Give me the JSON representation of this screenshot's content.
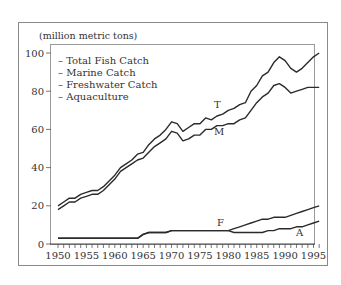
{
  "chart_data": {
    "type": "line",
    "title": "",
    "unit_label": "(million metric tons)",
    "xlabel": "",
    "ylabel": "(million metric tons)",
    "xlim": [
      1950,
      1996
    ],
    "ylim": [
      0,
      100
    ],
    "grid": false,
    "legend_position": "upper-left-inside",
    "x_ticks": [
      1950,
      1955,
      1960,
      1965,
      1970,
      1975,
      1980,
      1985,
      1990,
      1995
    ],
    "y_ticks": [
      0,
      20,
      40,
      60,
      80,
      100
    ],
    "legend": [
      "– Total Fish Catch",
      "– Marine Catch",
      "– Freshwater Catch",
      "– Aquaculture"
    ],
    "x": [
      1950,
      1951,
      1952,
      1953,
      1954,
      1955,
      1956,
      1957,
      1958,
      1959,
      1960,
      1961,
      1962,
      1963,
      1964,
      1965,
      1966,
      1967,
      1968,
      1969,
      1970,
      1971,
      1972,
      1973,
      1974,
      1975,
      1976,
      1977,
      1978,
      1979,
      1980,
      1981,
      1982,
      1983,
      1984,
      1985,
      1986,
      1987,
      1988,
      1989,
      1990,
      1991,
      1992,
      1993,
      1994,
      1995,
      1996
    ],
    "series": [
      {
        "name": "Total Fish Catch",
        "tag": "T",
        "values": [
          20,
          22,
          24,
          24,
          26,
          27,
          28,
          28,
          30,
          33,
          36,
          40,
          42,
          44,
          47,
          48,
          52,
          55,
          57,
          60,
          64,
          63,
          59,
          61,
          63,
          63,
          66,
          65,
          67,
          68,
          70,
          71,
          73,
          74,
          80,
          83,
          88,
          90,
          95,
          98,
          96,
          92,
          90,
          92,
          95,
          98,
          100
        ]
      },
      {
        "name": "Marine Catch",
        "tag": "M",
        "values": [
          18,
          20,
          22,
          22,
          24,
          25,
          26,
          26,
          28,
          31,
          34,
          38,
          40,
          42,
          44,
          45,
          48,
          51,
          53,
          55,
          59,
          58,
          54,
          55,
          57,
          57,
          60,
          60,
          62,
          62,
          63,
          63,
          65,
          66,
          70,
          74,
          77,
          79,
          83,
          84,
          82,
          79,
          80,
          81,
          82,
          82,
          82
        ]
      },
      {
        "name": "Freshwater Catch",
        "tag": "F",
        "values": [
          3,
          3,
          3,
          3,
          3,
          3,
          3,
          3,
          3,
          3,
          3,
          3,
          3,
          3,
          3,
          5,
          6,
          6,
          6,
          6,
          7,
          7,
          7,
          7,
          7,
          7,
          7,
          7,
          7,
          7,
          7,
          8,
          9,
          10,
          11,
          12,
          13,
          13,
          14,
          14,
          14,
          15,
          16,
          17,
          18,
          19,
          20
        ]
      },
      {
        "name": "Aquaculture",
        "tag": "A",
        "values": [
          3,
          3,
          3,
          3,
          3,
          3,
          3,
          3,
          3,
          3,
          3,
          3,
          3,
          3,
          3,
          5,
          6,
          6,
          6,
          6,
          7,
          7,
          7,
          7,
          7,
          7,
          7,
          7,
          7,
          7,
          7,
          6,
          6,
          6,
          6,
          6,
          6,
          7,
          7,
          8,
          8,
          8,
          9,
          9,
          10,
          11,
          12
        ]
      }
    ]
  }
}
